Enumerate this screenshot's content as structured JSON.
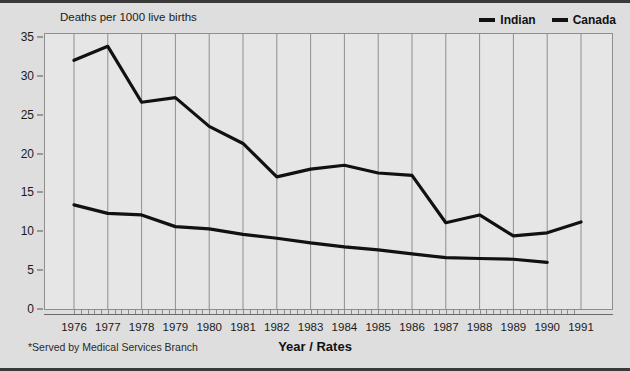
{
  "axis": {
    "y_title": "Deaths per 1000 live births",
    "x_title": "Year / Rates"
  },
  "footnote": "*Served by Medical Services Branch",
  "legend": {
    "items": [
      {
        "label": "Indian",
        "color": "#111111"
      },
      {
        "label": "Canada",
        "color": "#111111"
      }
    ]
  },
  "chart_data": {
    "type": "line",
    "title": "",
    "subtitle": "",
    "xlabel": "Year / Rates",
    "ylabel": "Deaths per 1000 live births",
    "xlim": [
      1976,
      1991
    ],
    "ylim": [
      0,
      35
    ],
    "yticks": [
      0,
      5,
      10,
      15,
      20,
      25,
      30,
      35
    ],
    "grid": "vertical",
    "legend_position": "top-right",
    "annotations": [
      "*Served by Medical Services Branch"
    ],
    "categories": [
      1976,
      1977,
      1978,
      1979,
      1980,
      1981,
      1982,
      1983,
      1984,
      1985,
      1986,
      1987,
      1988,
      1989,
      1990,
      1991
    ],
    "series": [
      {
        "name": "Indian",
        "color": "#111111",
        "values": [
          32.0,
          33.8,
          26.6,
          27.2,
          23.5,
          21.3,
          17.0,
          18.0,
          18.5,
          17.5,
          17.2,
          11.1,
          12.1,
          9.4,
          9.8,
          11.2
        ]
      },
      {
        "name": "Canada",
        "color": "#111111",
        "values": [
          13.4,
          12.3,
          12.1,
          10.6,
          10.3,
          9.6,
          9.1,
          8.5,
          8.0,
          7.6,
          7.1,
          6.6,
          6.5,
          6.4,
          6.0,
          null
        ]
      }
    ]
  }
}
